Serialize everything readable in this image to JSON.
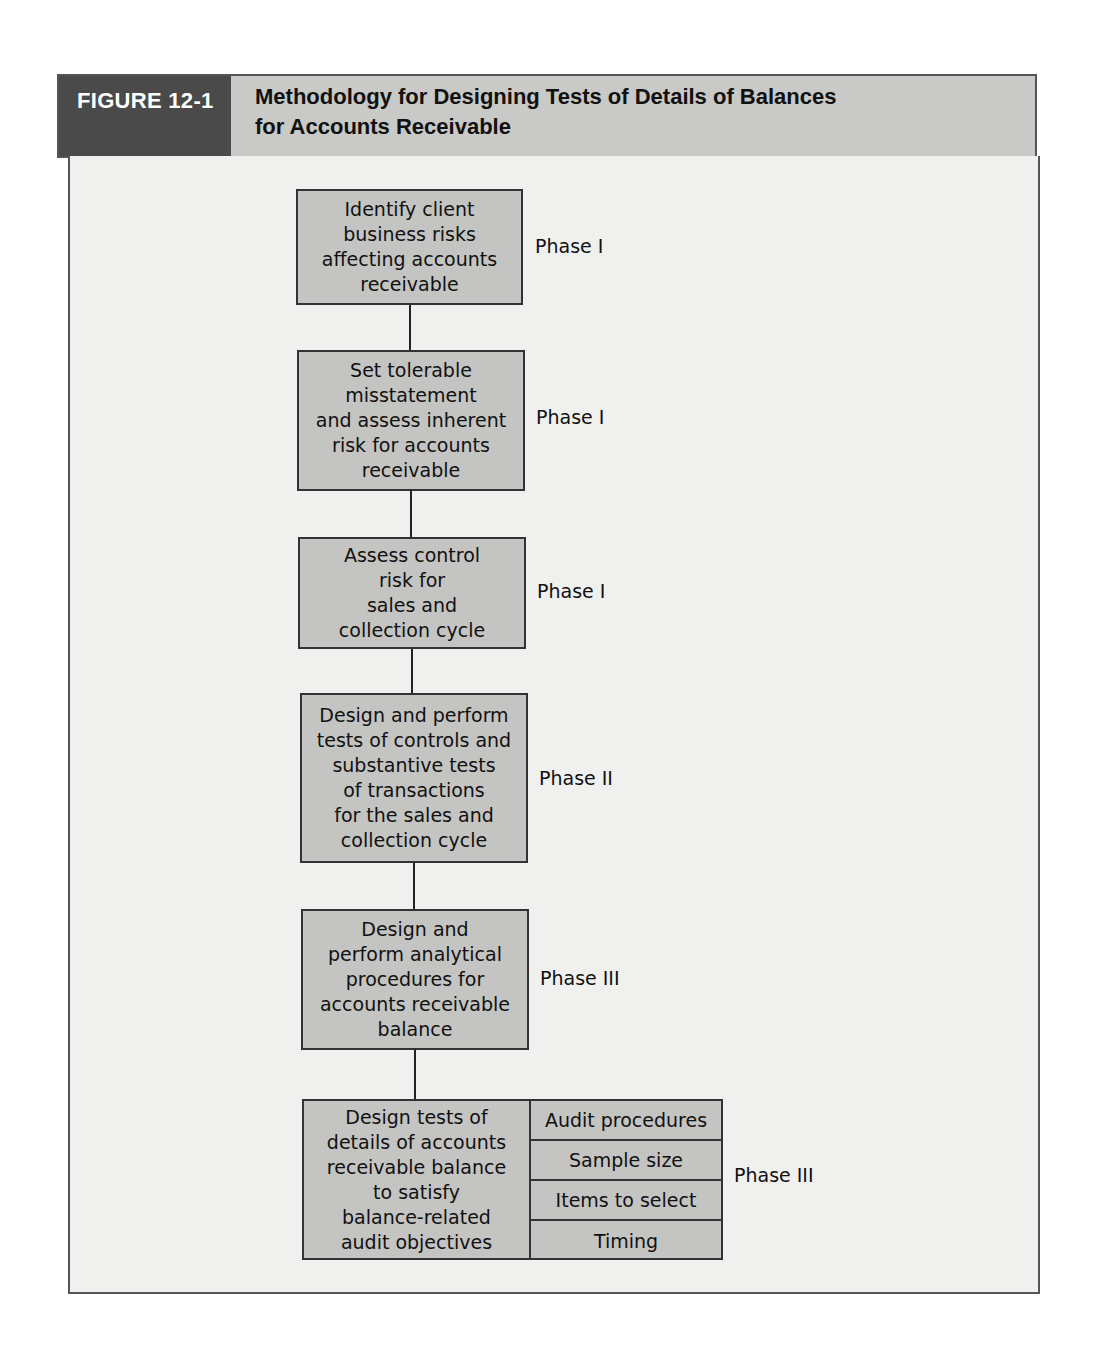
{
  "figure": {
    "label": "FIGURE 12-1",
    "title_line1": "Methodology for Designing Tests of Details of Balances",
    "title_line2": "for Accounts Receivable"
  },
  "steps": [
    {
      "lines": [
        "Identify client",
        "business risks",
        "affecting accounts",
        "receivable"
      ],
      "phase": "Phase I"
    },
    {
      "lines": [
        "Set tolerable",
        "misstatement",
        "and assess inherent",
        "risk for accounts",
        "receivable"
      ],
      "phase": "Phase I"
    },
    {
      "lines": [
        "Assess control",
        "risk for",
        "sales and",
        "collection cycle"
      ],
      "phase": "Phase I"
    },
    {
      "lines": [
        "Design and perform",
        "tests of controls and",
        "substantive tests",
        "of transactions",
        "for the sales and",
        "collection cycle"
      ],
      "phase": "Phase II"
    },
    {
      "lines": [
        "Design and",
        "perform analytical",
        "procedures for",
        "accounts receivable",
        "balance"
      ],
      "phase": "Phase III"
    },
    {
      "lines": [
        "Design tests of",
        "details of accounts",
        "receivable balance",
        "to satisfy",
        "balance-related",
        "audit objectives"
      ],
      "phase": "Phase III",
      "sub_items": [
        "Audit procedures",
        "Sample size",
        "Items to select",
        "Timing"
      ]
    }
  ],
  "colors": {
    "header_label_bg": "#4a4a4a",
    "header_title_bg": "#c9c9c7",
    "box_fill": "#c4c4c2",
    "panel_bg": "#f0f0ef"
  }
}
